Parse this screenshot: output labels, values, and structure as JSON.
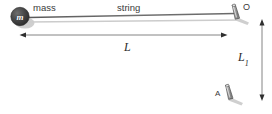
{
  "figure": {
    "background_color": "#ffffff",
    "labels": {
      "mass": "mass",
      "string": "string",
      "mass_symbol": "m",
      "length_L": "L",
      "length_L1_base": "L",
      "length_L1_subscript": "1",
      "point_O": "O",
      "point_A": "A"
    },
    "colors": {
      "line_dark": "#4a4a4a",
      "line_light": "#b8b8b8",
      "text": "#2b2b2b",
      "mass_fill_dark": "#3a3a3a",
      "mass_fill_mid": "#5c5c5c",
      "peg_fill": "#9a9a9a",
      "peg_stroke": "#4e4e4e",
      "shadow": "#c9c9c9"
    },
    "geometry": {
      "string_from_x": 30,
      "string_from_y": 17,
      "string_to_x": 234,
      "string_to_y": 14,
      "dim_L_y": 35,
      "dim_L_x1": 21,
      "dim_L_x2": 226,
      "dim_L1_x": 262,
      "dim_L1_y1": 20,
      "dim_L1_y2": 100,
      "mass_center_x": 20,
      "mass_center_y": 17,
      "mass_radius": 9,
      "peg_O_x": 234,
      "peg_O_y": 12,
      "peg_A_x": 228,
      "peg_A_y": 92
    }
  }
}
